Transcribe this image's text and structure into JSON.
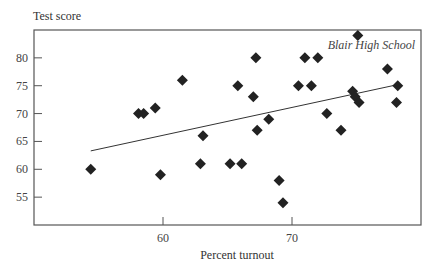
{
  "chart_data": {
    "type": "scatter",
    "title": "",
    "xlabel": "Percent turnout",
    "ylabel": "Test score",
    "annotation": "Blair High School",
    "xlim": [
      50,
      80
    ],
    "ylim": [
      50,
      85
    ],
    "x_ticks": [
      60,
      70
    ],
    "y_ticks": [
      55,
      60,
      65,
      70,
      75,
      80
    ],
    "grid": false,
    "legend": null,
    "marker": "diamond",
    "marker_color": "#222222",
    "points": [
      {
        "x": 54.4,
        "y": 60
      },
      {
        "x": 58.1,
        "y": 70
      },
      {
        "x": 58.5,
        "y": 70
      },
      {
        "x": 59.4,
        "y": 71
      },
      {
        "x": 59.8,
        "y": 59
      },
      {
        "x": 61.5,
        "y": 76
      },
      {
        "x": 62.9,
        "y": 61
      },
      {
        "x": 63.1,
        "y": 66
      },
      {
        "x": 65.2,
        "y": 61
      },
      {
        "x": 65.8,
        "y": 75
      },
      {
        "x": 66.1,
        "y": 61
      },
      {
        "x": 67.0,
        "y": 73
      },
      {
        "x": 67.2,
        "y": 80
      },
      {
        "x": 67.3,
        "y": 67
      },
      {
        "x": 68.2,
        "y": 69
      },
      {
        "x": 69.0,
        "y": 58
      },
      {
        "x": 69.3,
        "y": 54
      },
      {
        "x": 70.5,
        "y": 75
      },
      {
        "x": 71.0,
        "y": 80
      },
      {
        "x": 71.5,
        "y": 75
      },
      {
        "x": 72.0,
        "y": 80
      },
      {
        "x": 72.7,
        "y": 70
      },
      {
        "x": 73.8,
        "y": 67
      },
      {
        "x": 74.7,
        "y": 74
      },
      {
        "x": 74.9,
        "y": 73
      },
      {
        "x": 75.1,
        "y": 84
      },
      {
        "x": 75.2,
        "y": 72
      },
      {
        "x": 77.4,
        "y": 78
      },
      {
        "x": 78.1,
        "y": 72
      },
      {
        "x": 78.2,
        "y": 75
      }
    ],
    "trend_line": {
      "x1": 54.4,
      "y1": 63.3,
      "x2": 78.2,
      "y2": 75.2
    }
  },
  "labels": {
    "ylabel": "Test score",
    "xlabel": "Percent turnout",
    "annotation": "Blair High School"
  }
}
